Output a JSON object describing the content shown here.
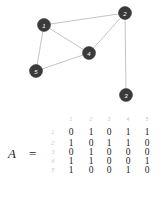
{
  "graph": {
    "nodes": [
      {
        "id": "1",
        "label": "1",
        "x": 44,
        "y": 25
      },
      {
        "id": "2",
        "label": "2",
        "x": 125,
        "y": 13
      },
      {
        "id": "3",
        "label": "3",
        "x": 126,
        "y": 95
      },
      {
        "id": "4",
        "label": "4",
        "x": 89,
        "y": 53
      },
      {
        "id": "5",
        "label": "5",
        "x": 36,
        "y": 71
      }
    ],
    "edges": [
      [
        "1",
        "2"
      ],
      [
        "1",
        "4"
      ],
      [
        "1",
        "5"
      ],
      [
        "2",
        "3"
      ],
      [
        "2",
        "4"
      ],
      [
        "4",
        "5"
      ]
    ],
    "colors": {
      "node": "#3a3a3a",
      "edge": "#c4c4c4",
      "label": "#ffffff"
    }
  },
  "matrix": {
    "name": "A",
    "equals": "=",
    "col_headers": [
      "1",
      "2",
      "3",
      "4",
      "5"
    ],
    "row_headers": [
      "1",
      "2",
      "3",
      "4",
      "5"
    ],
    "rows": [
      [
        "0",
        "1",
        "0",
        "1",
        "1"
      ],
      [
        "1",
        "0",
        "1",
        "1",
        "0"
      ],
      [
        "0",
        "1",
        "0",
        "0",
        "0"
      ],
      [
        "1",
        "1",
        "0",
        "0",
        "1"
      ],
      [
        "1",
        "0",
        "0",
        "1",
        "0"
      ]
    ]
  }
}
